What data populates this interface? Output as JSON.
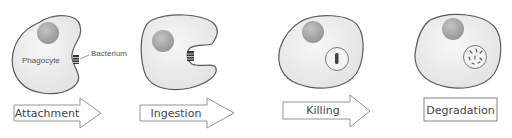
{
  "diagram": {
    "annotations": {
      "phagocyte": "Phagocyte",
      "bacterium": "Bacterium"
    },
    "steps": [
      {
        "label": "Attachment",
        "shape": "arrow"
      },
      {
        "label": "Ingestion",
        "shape": "arrow"
      },
      {
        "label": "Killing",
        "shape": "arrow"
      },
      {
        "label": "Degradation",
        "shape": "box"
      }
    ],
    "colors": {
      "cell_fill": "#ececec",
      "cell_stroke": "#5a5a5a",
      "nucleus": "#a8a8a8",
      "bacterium": "#333333",
      "arrow_fill": "#ffffff",
      "arrow_stroke": "#888888"
    }
  }
}
